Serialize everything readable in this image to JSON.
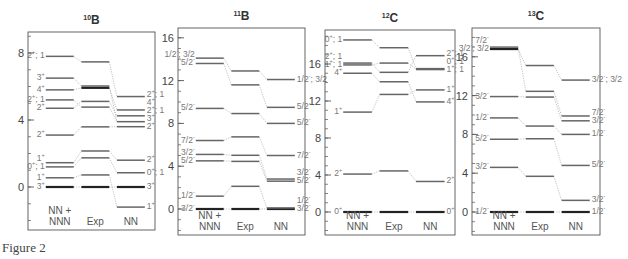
{
  "caption": "Figure 2",
  "chart_data": [
    {
      "type": "level-scheme",
      "title": "10B",
      "title_sup": "10",
      "title_main": "B",
      "columns": [
        "NN +\nNNN",
        "Exp",
        "NN"
      ],
      "yticks": [
        0,
        4,
        8
      ],
      "ylim": [
        -2.6,
        9.2
      ],
      "frame": {
        "x": 28,
        "y": 32,
        "w": 127,
        "h": 198,
        "y0": 187,
        "scale": 16.75
      },
      "levels": {
        "nnn": [
          {
            "E": 0.0,
            "label": "3+",
            "bold": true
          },
          {
            "E": 0.55,
            "label": "1+"
          },
          {
            "E": 1.2,
            "label": "0+; 1"
          },
          {
            "E": 1.45,
            "label": "1+"
          },
          {
            "E": 3.1,
            "label": "2+"
          },
          {
            "E": 4.7,
            "label": "2+"
          },
          {
            "E": 5.2,
            "label": "2+; 1"
          },
          {
            "E": 5.8,
            "label": "4+"
          },
          {
            "E": 6.5,
            "label": "3+"
          },
          {
            "E": 7.8,
            "label": "2+; 1"
          }
        ],
        "exp": [
          {
            "E": 0.0,
            "bold": true
          },
          {
            "E": 0.72
          },
          {
            "E": 1.74
          },
          {
            "E": 2.15
          },
          {
            "E": 3.59
          },
          {
            "E": 4.77
          },
          {
            "E": 5.11
          },
          {
            "E": 5.92,
            "bold": true
          },
          {
            "E": 6.03
          },
          {
            "E": 7.47
          }
        ],
        "nn": [
          {
            "E": -1.2,
            "label": "1+"
          },
          {
            "E": 0.0,
            "label": "3+",
            "bold": true
          },
          {
            "E": 0.85,
            "label": "0+; 1"
          },
          {
            "E": 1.6,
            "label": "2+"
          },
          {
            "E": 3.6,
            "label": "2+"
          },
          {
            "E": 3.9,
            "label": "3+"
          },
          {
            "E": 4.25,
            "label": "2+; 1"
          },
          {
            "E": 4.6,
            "label": "4+"
          },
          {
            "E": 5.4,
            "label": "2+; 1"
          }
        ]
      },
      "links": [
        [
          "nnn",
          0,
          "exp",
          0
        ],
        [
          "exp",
          0,
          "nn",
          1
        ],
        [
          "nnn",
          1,
          "exp",
          1
        ],
        [
          "exp",
          1,
          "nn",
          0
        ],
        [
          "nnn",
          2,
          "exp",
          2
        ],
        [
          "exp",
          2,
          "nn",
          2
        ],
        [
          "nnn",
          3,
          "exp",
          3
        ],
        [
          "exp",
          3,
          "nn",
          3
        ],
        [
          "nnn",
          4,
          "exp",
          4
        ],
        [
          "exp",
          4,
          "nn",
          4
        ],
        [
          "nnn",
          5,
          "exp",
          6
        ],
        [
          "exp",
          6,
          "nn",
          6
        ],
        [
          "nnn",
          6,
          "exp",
          5
        ],
        [
          "exp",
          5,
          "nn",
          5
        ],
        [
          "nnn",
          7,
          "exp",
          7
        ],
        [
          "exp",
          7,
          "nn",
          7
        ],
        [
          "nnn",
          8,
          "exp",
          8
        ],
        [
          "exp",
          8,
          "nn",
          5
        ],
        [
          "nnn",
          9,
          "exp",
          9
        ],
        [
          "exp",
          9,
          "nn",
          8
        ]
      ]
    },
    {
      "type": "level-scheme",
      "title": "11B",
      "title_sup": "11",
      "title_main": "B",
      "columns": [
        "NN +\nNNN",
        "Exp",
        "NN"
      ],
      "yticks": [
        0,
        4,
        8,
        12,
        16
      ],
      "ylim": [
        -2.2,
        17.0
      ],
      "frame": {
        "x": 178,
        "y": 28,
        "w": 127,
        "h": 207,
        "y0": 209,
        "scale": 10.7
      },
      "levels": {
        "nnn": [
          {
            "E": 0.0,
            "label": "3/2-",
            "bold": true
          },
          {
            "E": 1.2,
            "label": "1/2-"
          },
          {
            "E": 4.5,
            "label": "5/2-"
          },
          {
            "E": 5.1,
            "label": "3/2-"
          },
          {
            "E": 6.4,
            "label": "7/2-"
          },
          {
            "E": 9.4,
            "label": "5/2-"
          },
          {
            "E": 13.6,
            "label": "5/2-"
          },
          {
            "E": 14.1,
            "label": "1/2-; 3/2"
          }
        ],
        "exp": [
          {
            "E": 0.0,
            "bold": true
          },
          {
            "E": 2.12
          },
          {
            "E": 4.45
          },
          {
            "E": 5.02
          },
          {
            "E": 6.74
          },
          {
            "E": 8.92
          },
          {
            "E": 11.6
          },
          {
            "E": 12.9
          }
        ],
        "nn": [
          {
            "E": 0.0,
            "label": "3/2-",
            "bold": true
          },
          {
            "E": 0.1,
            "label": "1/2-"
          },
          {
            "E": 2.6,
            "label": "5/2-"
          },
          {
            "E": 2.8,
            "label": "3/2-"
          },
          {
            "E": 5.0,
            "label": "7/2-"
          },
          {
            "E": 8.0,
            "label": "5/2-"
          },
          {
            "E": 9.5,
            "label": "5/2-"
          },
          {
            "E": 12.1,
            "label": "1/2-; 3/2"
          }
        ]
      },
      "links": [
        [
          "nnn",
          0,
          "exp",
          0
        ],
        [
          "exp",
          0,
          "nn",
          0
        ],
        [
          "nnn",
          1,
          "exp",
          1
        ],
        [
          "exp",
          1,
          "nn",
          1
        ],
        [
          "nnn",
          2,
          "exp",
          2
        ],
        [
          "exp",
          2,
          "nn",
          2
        ],
        [
          "nnn",
          3,
          "exp",
          3
        ],
        [
          "exp",
          3,
          "nn",
          3
        ],
        [
          "nnn",
          4,
          "exp",
          4
        ],
        [
          "exp",
          4,
          "nn",
          4
        ],
        [
          "nnn",
          5,
          "exp",
          5
        ],
        [
          "exp",
          5,
          "nn",
          5
        ],
        [
          "nnn",
          6,
          "exp",
          6
        ],
        [
          "exp",
          6,
          "nn",
          6
        ],
        [
          "nnn",
          7,
          "exp",
          7
        ],
        [
          "exp",
          7,
          "nn",
          7
        ]
      ]
    },
    {
      "type": "level-scheme",
      "title": "12C",
      "title_sup": "12",
      "title_main": "C",
      "columns": [
        "NN +\nNNN",
        "Exp",
        "NN"
      ],
      "yticks": [
        0,
        4,
        8,
        12,
        16
      ],
      "ylim": [
        -2.5,
        19.5
      ],
      "frame": {
        "x": 325,
        "y": 30,
        "w": 130,
        "h": 205,
        "y0": 212,
        "scale": 9.25
      },
      "levels": {
        "nnn": [
          {
            "E": 0.0,
            "label": "0+",
            "bold": true
          },
          {
            "E": 4.1,
            "label": "2+"
          },
          {
            "E": 10.8,
            "label": "1+"
          },
          {
            "E": 15.0,
            "label": "4+"
          },
          {
            "E": 15.9,
            "label": "1+; 1"
          },
          {
            "E": 16.1,
            "label": "2+; 1"
          },
          {
            "E": 18.6,
            "label": "0+; 1"
          }
        ],
        "exp": [
          {
            "E": 0.0,
            "bold": true
          },
          {
            "E": 4.44
          },
          {
            "E": 12.71
          },
          {
            "E": 14.08
          },
          {
            "E": 15.1
          },
          {
            "E": 16.1
          },
          {
            "E": 17.76
          }
        ],
        "nn": [
          {
            "E": 0.0,
            "label": "0+",
            "bold": true
          },
          {
            "E": 3.3,
            "label": "2+"
          },
          {
            "E": 11.9,
            "label": "4+"
          },
          {
            "E": 13.2,
            "label": "1+"
          },
          {
            "E": 15.4,
            "label": "1+; 1"
          },
          {
            "E": 15.5,
            "label": "0+; 1"
          },
          {
            "E": 16.9,
            "label": "2+; 1"
          }
        ]
      },
      "links": [
        [
          "nnn",
          0,
          "exp",
          0
        ],
        [
          "exp",
          0,
          "nn",
          0
        ],
        [
          "nnn",
          1,
          "exp",
          1
        ],
        [
          "exp",
          1,
          "nn",
          1
        ],
        [
          "nnn",
          2,
          "exp",
          2
        ],
        [
          "exp",
          2,
          "nn",
          3
        ],
        [
          "nnn",
          3,
          "exp",
          3
        ],
        [
          "exp",
          3,
          "nn",
          2
        ],
        [
          "nnn",
          4,
          "exp",
          5
        ],
        [
          "exp",
          5,
          "nn",
          4
        ],
        [
          "nnn",
          5,
          "exp",
          4
        ],
        [
          "exp",
          4,
          "nn",
          6
        ],
        [
          "nnn",
          6,
          "exp",
          6
        ],
        [
          "exp",
          6,
          "nn",
          5
        ]
      ]
    },
    {
      "type": "level-scheme",
      "title": "13C",
      "title_sup": "13",
      "title_main": "C",
      "columns": [
        "NN +\nNNN",
        "Exp",
        "NN"
      ],
      "yticks": [
        0,
        4,
        8,
        12,
        16
      ],
      "ylim": [
        -2.4,
        18.9
      ],
      "frame": {
        "x": 472,
        "y": 28,
        "w": 128,
        "h": 207,
        "y0": 212,
        "scale": 9.7
      },
      "levels": {
        "nnn": [
          {
            "E": 0.0,
            "label": "1/2-",
            "bold": true
          },
          {
            "E": 4.6,
            "label": "3/2-"
          },
          {
            "E": 7.5,
            "label": "5/2-"
          },
          {
            "E": 9.7,
            "label": "1/2-"
          },
          {
            "E": 11.9,
            "label": "3/2-"
          },
          {
            "E": 16.8,
            "label": "3/2-; 3/2",
            "bold": true
          },
          {
            "E": 17.0,
            "label": "7/2-"
          }
        ],
        "exp": [
          {
            "E": 0.0,
            "bold": true
          },
          {
            "E": 3.68
          },
          {
            "E": 7.55
          },
          {
            "E": 8.86
          },
          {
            "E": 11.85
          },
          {
            "E": 12.44
          },
          {
            "E": 15.1
          }
        ],
        "nn": [
          {
            "E": 0.0,
            "label": "1/2-",
            "bold": true
          },
          {
            "E": 1.2,
            "label": "3/2-"
          },
          {
            "E": 4.8,
            "label": "5/2-"
          },
          {
            "E": 8.0,
            "label": "1/2-"
          },
          {
            "E": 9.4,
            "label": "3/2-"
          },
          {
            "E": 9.9,
            "label": "7/2-"
          },
          {
            "E": 13.6,
            "label": "3/2-; 3/2"
          }
        ]
      },
      "links": [
        [
          "nnn",
          0,
          "exp",
          0
        ],
        [
          "exp",
          0,
          "nn",
          0
        ],
        [
          "nnn",
          1,
          "exp",
          1
        ],
        [
          "exp",
          1,
          "nn",
          1
        ],
        [
          "nnn",
          2,
          "exp",
          2
        ],
        [
          "exp",
          2,
          "nn",
          2
        ],
        [
          "nnn",
          3,
          "exp",
          3
        ],
        [
          "exp",
          3,
          "nn",
          3
        ],
        [
          "nnn",
          4,
          "exp",
          4
        ],
        [
          "exp",
          4,
          "nn",
          4
        ],
        [
          "nnn",
          5,
          "exp",
          6
        ],
        [
          "exp",
          6,
          "nn",
          6
        ],
        [
          "nnn",
          6,
          "exp",
          5
        ],
        [
          "exp",
          5,
          "nn",
          5
        ]
      ]
    }
  ]
}
